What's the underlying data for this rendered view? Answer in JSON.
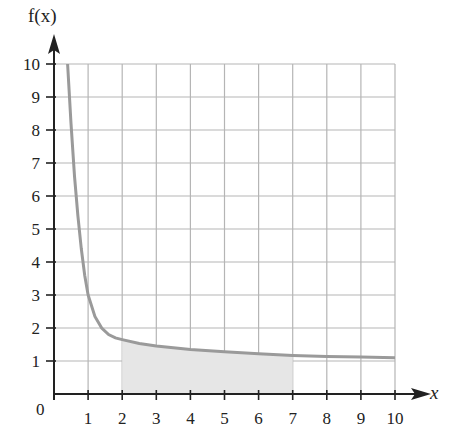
{
  "chart_data": {
    "type": "line",
    "title": "",
    "xlabel": "x",
    "ylabel": "f(x)",
    "origin_label": "0",
    "xlim": [
      0,
      10
    ],
    "ylim": [
      0,
      10
    ],
    "grid": true,
    "x_ticks": [
      "1",
      "2",
      "3",
      "4",
      "5",
      "6",
      "7",
      "8",
      "9",
      "10"
    ],
    "y_ticks": [
      "1",
      "2",
      "3",
      "4",
      "5",
      "6",
      "7",
      "8",
      "9",
      "10"
    ],
    "series": [
      {
        "name": "f(x)",
        "color": "#9a9a9a",
        "x": [
          0.4,
          0.5,
          0.6,
          0.7,
          0.8,
          0.9,
          1.0,
          1.2,
          1.4,
          1.6,
          1.8,
          2.0,
          2.5,
          3,
          4,
          5,
          6,
          7,
          8,
          9,
          10
        ],
        "y": [
          10.0,
          8.2,
          6.6,
          5.4,
          4.4,
          3.6,
          3.0,
          2.35,
          2.0,
          1.8,
          1.7,
          1.65,
          1.53,
          1.45,
          1.35,
          1.28,
          1.22,
          1.17,
          1.14,
          1.12,
          1.1
        ]
      }
    ],
    "shaded_region": {
      "x_from": 2,
      "x_to": 7,
      "under": "f(x)",
      "color": "#e6e6e6"
    }
  }
}
